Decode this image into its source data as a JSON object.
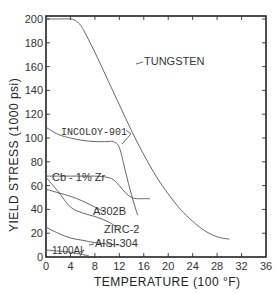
{
  "chart_data": {
    "type": "line",
    "title": "",
    "xlabel": "TEMPERATURE (100 °F)",
    "ylabel": "YIELD  STRESS (1000 psi)",
    "xlim": [
      0,
      36
    ],
    "ylim": [
      0,
      200
    ],
    "xticks": [
      0,
      4,
      8,
      12,
      16,
      20,
      24,
      28,
      32,
      36
    ],
    "yticks": [
      0,
      20,
      40,
      60,
      80,
      100,
      120,
      140,
      160,
      180,
      200
    ],
    "grid": false,
    "legend": "inline labels",
    "series": [
      {
        "name": "TUNGSTEN",
        "x": [
          0,
          2,
          4,
          5,
          6,
          8,
          10,
          12,
          14,
          16,
          18,
          20,
          22,
          24,
          26,
          28,
          30
        ],
        "y": [
          200,
          200,
          200,
          198,
          192,
          172,
          150,
          128,
          106,
          86,
          68,
          53,
          40,
          30,
          22,
          17,
          15
        ]
      },
      {
        "name": "INCOLOY-901",
        "x": [
          0,
          2,
          4,
          6,
          8,
          10,
          11,
          12,
          13,
          14,
          15
        ],
        "y": [
          109,
          103,
          100,
          98,
          97,
          97,
          97,
          92,
          72,
          52,
          35
        ]
      },
      {
        "name": "Cb - 1% Zr",
        "x": [
          0,
          2,
          4,
          6,
          8,
          10,
          11,
          12,
          13,
          14,
          15,
          16,
          17
        ],
        "y": [
          68,
          68,
          68,
          68,
          68,
          67,
          65,
          60,
          54,
          50,
          49,
          49,
          49
        ]
      },
      {
        "name": "A302B",
        "x": [
          0,
          2,
          4,
          6,
          8,
          9.5
        ],
        "y": [
          57,
          54,
          51,
          47,
          42,
          38
        ]
      },
      {
        "name": "ZIRC-2",
        "x": [
          0,
          2,
          4,
          6,
          8,
          10,
          12
        ],
        "y": [
          67,
          55,
          42,
          37,
          34,
          30,
          24
        ]
      },
      {
        "name": "AISI-304",
        "x": [
          0,
          2,
          4,
          6,
          8,
          10,
          12
        ],
        "y": [
          25,
          20,
          16,
          14,
          12,
          11,
          10
        ]
      },
      {
        "name": "1100Al",
        "x": [
          0,
          2,
          4,
          6,
          7
        ],
        "y": [
          6,
          5,
          4,
          2,
          1
        ]
      }
    ]
  },
  "labels": {
    "tungsten": "TUNGSTEN",
    "incoloy": "INCOLOY-901",
    "cb": "Cb - 1% Zr",
    "a302b": "A302B",
    "zirc": "ZIRC-2",
    "aisi": "AISI-304",
    "al": "1100Al",
    "xlabel": "TEMPERATURE (100 °F)",
    "ylabel": "YIELD  STRESS (1000 psi)"
  }
}
